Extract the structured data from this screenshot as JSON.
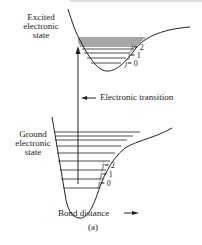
{
  "diagram": {
    "type": "potential-energy-curves",
    "excited_state": {
      "label_line1": "Excited",
      "label_line2": "electronic",
      "label_line3": "state",
      "levels": [
        {
          "symbol": "j",
          "eq": "= 2"
        },
        {
          "symbol": "j",
          "eq": "= 1"
        },
        {
          "symbol": "j",
          "eq": "= 0"
        }
      ]
    },
    "ground_state": {
      "label_line1": "Ground",
      "label_line2": "electronic",
      "label_line3": "state",
      "levels": [
        {
          "symbol": "j",
          "eq": "= 2"
        },
        {
          "symbol": "j",
          "eq": "= 1"
        },
        {
          "symbol": "j",
          "eq": "= 0"
        }
      ]
    },
    "transition_label": "Electronic transition",
    "x_axis_label": "Bond distance",
    "caption": "(a)",
    "colors": {
      "line": "#222222",
      "background": "#ffffff"
    }
  }
}
